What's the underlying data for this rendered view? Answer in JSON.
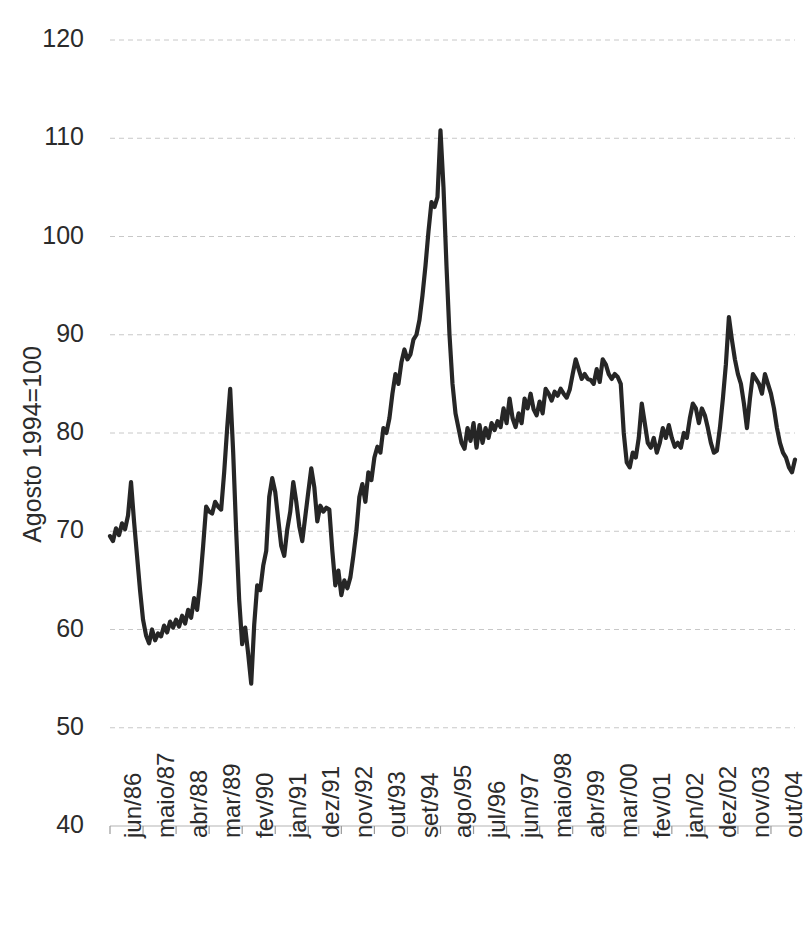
{
  "chart_data": {
    "type": "line",
    "title": "",
    "subtitle": "",
    "xlabel": "",
    "ylabel": "Agosto 1994=100",
    "ylim": [
      40,
      120
    ],
    "ytick_values": [
      40,
      50,
      60,
      70,
      80,
      90,
      100,
      110,
      120
    ],
    "ytick_labels": [
      "40",
      "50",
      "60",
      "70",
      "80",
      "90",
      "100",
      "110",
      "120"
    ],
    "grid": true,
    "legend": "none",
    "xtick_labels": [
      "jun/86",
      "maio/87",
      "abr/88",
      "mar/89",
      "fev/90",
      "jan/91",
      "dez/91",
      "nov/92",
      "out/93",
      "set/94",
      "ago/95",
      "jul/96",
      "jun/97",
      "maio/98",
      "abr/99",
      "mar/00",
      "fev/01",
      "jan/02",
      "dez/02",
      "nov/03",
      "out/04"
    ],
    "xtick_step_months": 11,
    "x_start_label": "jun/86",
    "x_end_label": "out/04",
    "series": [
      {
        "name": "Indice",
        "color": "#262626",
        "values": [
          69.5,
          69.0,
          70.3,
          69.6,
          70.8,
          70.2,
          71.6,
          75.0,
          71.0,
          67.5,
          64.0,
          61.0,
          59.4,
          58.6,
          60.0,
          58.9,
          59.6,
          59.3,
          60.4,
          59.7,
          60.8,
          60.2,
          61.0,
          60.3,
          61.4,
          60.6,
          62.0,
          61.2,
          63.2,
          62.0,
          64.8,
          68.5,
          72.5,
          72.0,
          71.8,
          73.0,
          72.5,
          72.2,
          76.0,
          80.5,
          84.5,
          78.0,
          70.0,
          63.0,
          58.5,
          60.2,
          57.5,
          54.5,
          60.5,
          64.5,
          64.0,
          66.5,
          68.0,
          73.5,
          75.4,
          74.0,
          71.2,
          68.5,
          67.5,
          70.2,
          72.0,
          75.0,
          73.0,
          70.5,
          69.0,
          71.5,
          74.0,
          76.4,
          74.5,
          71.0,
          72.6,
          72.0,
          72.4,
          72.2,
          68.0,
          64.5,
          66.0,
          63.5,
          65.0,
          64.2,
          65.3,
          67.5,
          70.0,
          73.5,
          74.8,
          73.0,
          76.0,
          75.2,
          77.5,
          78.6,
          78.0,
          80.5,
          80.0,
          81.5,
          84.0,
          86.0,
          85.0,
          87.2,
          88.5,
          87.5,
          88.0,
          89.5,
          90.0,
          91.5,
          94.0,
          97.0,
          100.5,
          103.5,
          103.0,
          104.0,
          110.8,
          105.0,
          97.0,
          90.0,
          85.0,
          82.0,
          80.5,
          79.0,
          78.4,
          80.5,
          79.2,
          81.0,
          78.5,
          80.8,
          79.0,
          80.5,
          79.5,
          81.0,
          80.3,
          81.2,
          80.6,
          82.5,
          81.0,
          83.5,
          81.5,
          80.6,
          82.0,
          81.0,
          83.5,
          82.5,
          84.0,
          82.4,
          81.8,
          83.2,
          82.0,
          84.5,
          84.0,
          83.3,
          84.2,
          83.8,
          84.5,
          84.0,
          83.6,
          84.4,
          86.0,
          87.5,
          86.5,
          85.5,
          86.0,
          85.5,
          85.4,
          85.0,
          86.5,
          85.2,
          87.5,
          87.0,
          86.0,
          85.5,
          86.0,
          85.7,
          85.0,
          80.0,
          77.0,
          76.5,
          78.0,
          77.5,
          79.5,
          83.0,
          81.0,
          79.0,
          78.5,
          79.5,
          78.0,
          79.0,
          80.5,
          79.5,
          80.8,
          79.5,
          78.6,
          79.0,
          78.5,
          80.0,
          79.5,
          81.5,
          83.0,
          82.5,
          81.0,
          82.5,
          81.8,
          80.5,
          79.0,
          78.0,
          78.2,
          80.5,
          83.5,
          87.0,
          91.8,
          89.5,
          87.5,
          86.0,
          85.0,
          83.0,
          80.5,
          83.5,
          86.0,
          85.5,
          85.0,
          84.0,
          86.0,
          85.0,
          84.0,
          82.5,
          80.5,
          79.0,
          78.0,
          77.5,
          76.5,
          76.0,
          77.3
        ]
      }
    ]
  }
}
